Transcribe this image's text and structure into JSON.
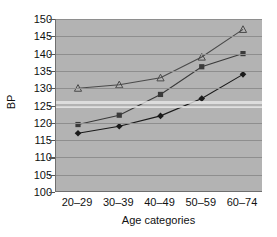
{
  "chart_data": {
    "type": "line",
    "title": "",
    "xlabel": "Age categories",
    "ylabel": "BP",
    "categories": [
      "20–29",
      "30–39",
      "40–49",
      "50–59",
      "60–74"
    ],
    "ylim": [
      100,
      150
    ],
    "yticks": [
      100,
      105,
      110,
      115,
      120,
      125,
      130,
      135,
      140,
      145,
      150
    ],
    "ytick_labels": [
      "100",
      "105",
      "110",
      "115",
      "120",
      "125",
      "130",
      "135",
      "140",
      "145",
      "150"
    ],
    "grid": true,
    "legend": "none",
    "series": [
      {
        "name": "series-open-triangle",
        "marker": "open-triangle",
        "color": "#4a4a4a",
        "values": [
          130,
          131,
          133,
          139,
          147
        ]
      },
      {
        "name": "series-filled-square",
        "marker": "filled-square",
        "color": "#3a3a3a",
        "values": [
          119.5,
          122.2,
          128.2,
          136.2,
          140
        ]
      },
      {
        "name": "series-filled-diamond",
        "marker": "filled-diamond",
        "color": "#1a1a1a",
        "values": [
          117,
          119,
          122,
          127,
          134
        ]
      }
    ]
  },
  "colors": {
    "plot_background": "#b3b3b3",
    "gridline": "#8e8e8e",
    "axis": "#6f6f6f",
    "text": "#111111",
    "page_background": "#ffffff"
  }
}
